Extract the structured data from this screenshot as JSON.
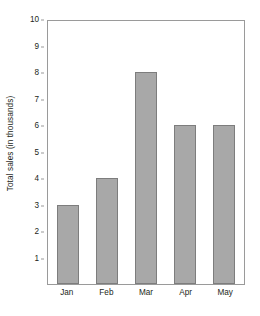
{
  "chart_data": {
    "type": "bar",
    "title": "",
    "xlabel": "",
    "ylabel": "Total sales (in thousands)",
    "categories": [
      "Jan",
      "Feb",
      "Mar",
      "Apr",
      "May"
    ],
    "values": [
      3,
      4,
      8,
      6,
      6
    ],
    "ylim": [
      0,
      10
    ],
    "y_ticks": [
      10,
      9,
      8,
      7,
      6,
      5,
      4,
      3,
      2,
      1
    ],
    "y_tick_labels": [
      "10",
      "9",
      "8",
      "7",
      "6",
      "5",
      "4",
      "3",
      "2",
      "1"
    ],
    "grid": false,
    "legend": null,
    "bar_color": "#a8a8a8",
    "bar_border_color": "#7d7d7d",
    "axis_color": "#9a9a9a",
    "text_color": "#231f20",
    "background_color": "#ffffff"
  }
}
